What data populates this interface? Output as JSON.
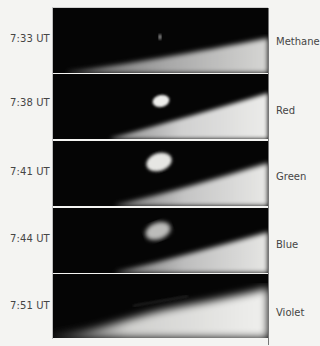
{
  "figure": {
    "panels": [
      {
        "time": "7:33 UT",
        "filter": "Methane",
        "plume": "faint-dot"
      },
      {
        "time": "7:38 UT",
        "filter": "Red",
        "plume": "small-bright"
      },
      {
        "time": "7:41 UT",
        "filter": "Green",
        "plume": "large-bright"
      },
      {
        "time": "7:44 UT",
        "filter": "Blue",
        "plume": "large-dimmer"
      },
      {
        "time": "7:51 UT",
        "filter": "Violet",
        "plume": "none"
      }
    ]
  },
  "colors": {
    "sky": "#050505",
    "limb": "#e9e9e6",
    "label_text": "#454545",
    "page_background": "#f4f4f2"
  }
}
